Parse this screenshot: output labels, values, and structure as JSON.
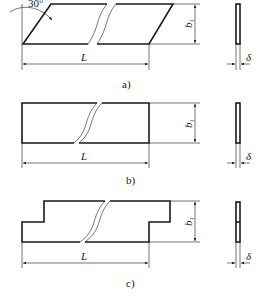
{
  "figures": [
    {
      "id": "a",
      "caption": "a)",
      "shape": "parallelogram",
      "angle_label": "30°",
      "length_label": "L",
      "height_label": "b1",
      "thickness_label": "δ"
    },
    {
      "id": "b",
      "caption": "b)",
      "shape": "rectangle",
      "length_label": "L",
      "height_label": "b1",
      "thickness_label": "δ"
    },
    {
      "id": "c",
      "caption": "c)",
      "shape": "stepped",
      "length_label": "L",
      "height_label": "b1",
      "thickness_label": "δ"
    }
  ],
  "labels": {
    "L": "L",
    "b": "b",
    "sub1": "1",
    "delta": "δ",
    "angle": "30°",
    "cap_a": "a)",
    "cap_b": "b)",
    "cap_c": "c)"
  }
}
